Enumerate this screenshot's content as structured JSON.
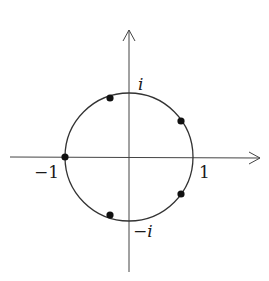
{
  "diagram": {
    "title": "",
    "axes": {
      "real_axis_arrow": true,
      "imaginary_axis_arrow": true
    },
    "labels": {
      "i": "i",
      "minus_i": "−i",
      "one": "1",
      "minus_one": "−1"
    },
    "points": [
      {
        "angle_deg": 36,
        "name": "point-36"
      },
      {
        "angle_deg": 108,
        "name": "point-108"
      },
      {
        "angle_deg": 180,
        "name": "point-180"
      },
      {
        "angle_deg": 252,
        "name": "point-252"
      },
      {
        "angle_deg": 324,
        "name": "point-324"
      }
    ],
    "colors": {
      "stroke": "#333333",
      "point": "#111111",
      "background": "#ffffff"
    }
  }
}
